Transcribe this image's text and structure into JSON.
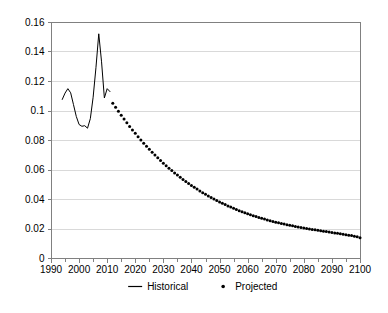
{
  "chart_data": {
    "type": "line",
    "title": "",
    "xlabel": "",
    "ylabel": "",
    "xlim": [
      1990,
      2100
    ],
    "ylim": [
      0,
      0.16
    ],
    "grid": true,
    "grid_axis": "y",
    "legend_position": "bottom-center",
    "y_ticks": [
      "0",
      "0.02",
      "0.04",
      "0.06",
      "0.08",
      "0.1",
      "0.12",
      "0.14",
      "0.16"
    ],
    "y_tick_values": [
      0,
      0.02,
      0.04,
      0.06,
      0.08,
      0.1,
      0.12,
      0.14,
      0.16
    ],
    "x_ticks": [
      "1990",
      "2000",
      "2010",
      "2020",
      "2030",
      "2040",
      "2050",
      "2060",
      "2070",
      "2080",
      "2090",
      "2100"
    ],
    "x_tick_values": [
      1990,
      2000,
      2010,
      2020,
      2030,
      2040,
      2050,
      2060,
      2070,
      2080,
      2090,
      2100
    ],
    "x_minor_tick_values": [
      1995,
      2005,
      2015,
      2025,
      2035,
      2045,
      2055,
      2065,
      2075,
      2085,
      2095
    ],
    "series": [
      {
        "name": "Historical",
        "style": "line",
        "color": "#000000",
        "x": [
          1994,
          1995,
          1996,
          1997,
          1998,
          1999,
          2000,
          2001,
          2002,
          2003,
          2004,
          2005,
          2006,
          2007,
          2008,
          2009,
          2010,
          2011
        ],
        "values": [
          0.1075,
          0.1118,
          0.1148,
          0.112,
          0.104,
          0.096,
          0.0905,
          0.0893,
          0.0897,
          0.088,
          0.0945,
          0.109,
          0.129,
          0.152,
          0.133,
          0.1085,
          0.1148,
          0.1128
        ]
      },
      {
        "name": "Projected",
        "style": "dots",
        "color": "#000000",
        "x": [
          2012,
          2013,
          2014,
          2015,
          2016,
          2017,
          2018,
          2019,
          2020,
          2021,
          2022,
          2023,
          2024,
          2025,
          2026,
          2027,
          2028,
          2029,
          2030,
          2031,
          2032,
          2033,
          2034,
          2035,
          2036,
          2037,
          2038,
          2039,
          2040,
          2041,
          2042,
          2043,
          2044,
          2045,
          2046,
          2047,
          2048,
          2049,
          2050,
          2051,
          2052,
          2053,
          2054,
          2055,
          2056,
          2057,
          2058,
          2059,
          2060,
          2061,
          2062,
          2063,
          2064,
          2065,
          2066,
          2067,
          2068,
          2069,
          2070,
          2071,
          2072,
          2073,
          2074,
          2075,
          2076,
          2077,
          2078,
          2079,
          2080,
          2081,
          2082,
          2083,
          2084,
          2085,
          2086,
          2087,
          2088,
          2089,
          2090,
          2091,
          2092,
          2093,
          2094,
          2095,
          2096,
          2097,
          2098,
          2099,
          2100
        ],
        "values": [
          0.105,
          0.1022,
          0.0995,
          0.0968,
          0.0942,
          0.0917,
          0.0892,
          0.0868,
          0.0845,
          0.0822,
          0.08,
          0.0778,
          0.0757,
          0.0737,
          0.0717,
          0.0698,
          0.0679,
          0.0661,
          0.0643,
          0.0626,
          0.0609,
          0.0593,
          0.0577,
          0.0562,
          0.0547,
          0.0533,
          0.0519,
          0.0505,
          0.0492,
          0.0479,
          0.0467,
          0.0455,
          0.0443,
          0.0432,
          0.0421,
          0.041,
          0.04,
          0.039,
          0.038,
          0.0371,
          0.0362,
          0.0353,
          0.0345,
          0.0337,
          0.0329,
          0.0321,
          0.0314,
          0.0307,
          0.03,
          0.0293,
          0.0287,
          0.0281,
          0.0275,
          0.0269,
          0.0264,
          0.0258,
          0.0253,
          0.0248,
          0.0243,
          0.0239,
          0.0234,
          0.023,
          0.0226,
          0.0222,
          0.0218,
          0.0214,
          0.0211,
          0.0207,
          0.0204,
          0.02,
          0.0197,
          0.0194,
          0.0191,
          0.0188,
          0.0185,
          0.0182,
          0.0179,
          0.0176,
          0.0173,
          0.017,
          0.0167,
          0.0164,
          0.0161,
          0.0158,
          0.0155,
          0.0152,
          0.0148,
          0.0144,
          0.0138
        ]
      }
    ],
    "legend": [
      {
        "label": "Historical",
        "marker": "line",
        "color": "#000000"
      },
      {
        "label": "Projected",
        "marker": "dot",
        "color": "#000000"
      }
    ]
  },
  "style": {
    "axis_color": "#808080",
    "grid_color": "#d9d9d9",
    "series_color": "#000000",
    "background": "#ffffff"
  }
}
